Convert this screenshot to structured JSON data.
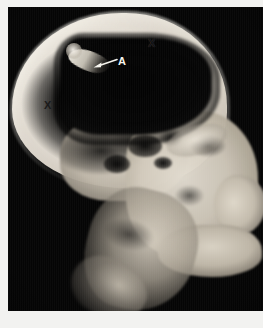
{
  "figure": {
    "kind": "lateral-skull-radiograph",
    "modality_label": "plain lateral skull radiograph",
    "background_color": "#060606",
    "paper_color": "#f2f2f0",
    "plate": {
      "x": 8,
      "y": 7,
      "width": 255,
      "height": 304
    }
  },
  "annotations": {
    "markers": [
      {
        "id": "marker-x-vertex",
        "text": "X",
        "x": 146,
        "y": 37,
        "color": "#121212",
        "points_at": "vertex-calvarium"
      },
      {
        "id": "marker-x-occiput",
        "text": "X",
        "x": 42,
        "y": 99,
        "color": "#1a1a1a",
        "points_at": "occipital-calvarium"
      },
      {
        "id": "marker-a-label",
        "text": "A",
        "x": 114,
        "y": 54,
        "color": "#f6f4ee",
        "points_at": "depressed-bone-fragment"
      }
    ],
    "leader_arrow": {
      "id": "leader-arrow",
      "from_x": 110,
      "from_y": 53,
      "to_x": 86,
      "to_y": 60,
      "color": "#f6f4ee"
    }
  },
  "anatomy": {
    "regions": [
      {
        "id": "cranial-vault",
        "label": "cranial vault",
        "tone": "bright"
      },
      {
        "id": "calvarium-band",
        "label": "calvarium band",
        "tone": "bright"
      },
      {
        "id": "intracranial-lucency",
        "label": "intracranial lucency",
        "tone": "dark"
      },
      {
        "id": "inner-table-shadow",
        "label": "inner table shadow",
        "tone": "dark"
      },
      {
        "id": "skull-base",
        "label": "skull base",
        "tone": "mottled"
      },
      {
        "id": "facial-mass",
        "label": "facial bone mass",
        "tone": "bright"
      },
      {
        "id": "nasal-profile",
        "label": "nasal profile",
        "tone": "bright"
      },
      {
        "id": "mandible",
        "label": "mandible",
        "tone": "bright"
      },
      {
        "id": "cervical-column",
        "label": "cervical soft tissue column",
        "tone": "mid"
      },
      {
        "id": "cervical-spur",
        "label": "lower cervical structures",
        "tone": "mid"
      },
      {
        "id": "sphenoid-streak",
        "label": "sphenoid streak",
        "tone": "bright"
      },
      {
        "id": "bone-fragment",
        "label": "depressed bone fragment",
        "tone": "bright"
      }
    ]
  }
}
